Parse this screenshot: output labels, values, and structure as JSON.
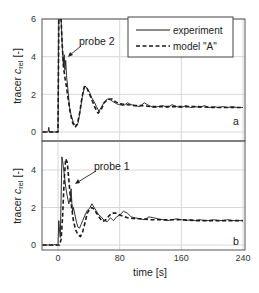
{
  "chart_data": [
    {
      "type": "line",
      "panel": "a",
      "annotation": "probe 2",
      "xlabel": "time [s]",
      "ylabel": "tracer c_rel [-]",
      "xlim": [
        -20,
        240
      ],
      "ylim": [
        -0.5,
        6
      ],
      "xticks": [
        0,
        80,
        160,
        240
      ],
      "yticks": [
        0,
        2,
        4,
        6
      ],
      "grid": true,
      "legend": {
        "position": "upper right",
        "entries": [
          "experiment",
          "model \"A\""
        ]
      },
      "series": [
        {
          "name": "experiment",
          "style": "solid",
          "x": [
            -20,
            -13,
            -12,
            -11,
            0,
            0.5,
            1,
            2,
            3,
            4,
            5,
            6,
            7,
            8,
            9,
            10,
            11,
            12,
            13,
            15,
            17,
            20,
            23,
            26,
            29,
            32,
            35,
            38,
            41,
            44,
            47,
            50,
            53,
            56,
            60,
            64,
            68,
            72,
            76,
            80,
            85,
            90,
            95,
            100,
            106,
            112,
            118,
            124,
            130,
            136,
            142,
            148,
            154,
            160,
            166,
            172,
            178,
            184,
            190,
            196,
            202,
            208,
            214,
            220,
            226,
            232,
            238,
            240
          ],
          "y": [
            0,
            0,
            0.25,
            0,
            0,
            3,
            6,
            6,
            6,
            6,
            5,
            4.2,
            3.6,
            4.1,
            3.3,
            3.8,
            3.0,
            2.6,
            2.2,
            1.3,
            0.9,
            0.5,
            0.35,
            0.45,
            1.2,
            2.0,
            2.45,
            2.3,
            2.1,
            1.8,
            1.6,
            1.35,
            1.1,
            1.3,
            1.6,
            1.75,
            1.7,
            1.6,
            1.5,
            1.45,
            1.4,
            1.55,
            1.45,
            1.4,
            1.35,
            1.55,
            1.4,
            1.3,
            1.35,
            1.4,
            1.3,
            1.45,
            1.35,
            1.3,
            1.4,
            1.3,
            1.35,
            1.3,
            1.4,
            1.3,
            1.35,
            1.3,
            1.35,
            1.3,
            1.35,
            1.3,
            1.3,
            1.3
          ]
        },
        {
          "name": "model \"A\"",
          "style": "dashed",
          "x": [
            -20,
            0,
            1,
            1.5,
            3,
            4,
            5,
            7,
            9,
            11,
            13,
            16,
            19,
            22,
            25,
            28,
            31,
            34,
            37,
            40,
            44,
            48,
            52,
            56,
            60,
            65,
            70,
            75,
            80,
            90,
            100,
            110,
            120,
            140,
            160,
            180,
            200,
            220,
            240
          ],
          "y": [
            0,
            0,
            6,
            6,
            6,
            6,
            5,
            3.5,
            2.9,
            2.4,
            1.8,
            1.0,
            0.5,
            0.25,
            0.4,
            1.0,
            1.8,
            2.4,
            2.4,
            2.1,
            1.7,
            1.3,
            1.0,
            1.2,
            1.55,
            1.75,
            1.75,
            1.6,
            1.5,
            1.45,
            1.4,
            1.4,
            1.35,
            1.35,
            1.35,
            1.35,
            1.3,
            1.3,
            1.3
          ]
        }
      ]
    },
    {
      "type": "line",
      "panel": "b",
      "annotation": "probe 1",
      "xlabel": "time [s]",
      "ylabel": "tracer c_rel [-]",
      "xlim": [
        -20,
        240
      ],
      "ylim": [
        -0.3,
        5.5
      ],
      "xticks": [
        0,
        80,
        160,
        240
      ],
      "yticks": [
        0,
        2,
        4
      ],
      "grid": true,
      "series": [
        {
          "name": "experiment",
          "style": "solid",
          "x": [
            -20,
            -5,
            -4,
            -3,
            -2,
            0,
            1,
            2,
            3,
            4,
            5,
            6,
            8,
            10,
            12,
            14,
            16,
            17,
            18,
            19,
            20,
            22,
            24,
            26,
            28,
            30,
            32,
            35,
            38,
            41,
            44,
            47,
            50,
            53,
            56,
            60,
            64,
            68,
            72,
            76,
            80,
            85,
            90,
            95,
            100,
            106,
            112,
            118,
            124,
            130,
            136,
            142,
            148,
            154,
            160,
            166,
            172,
            178,
            184,
            190,
            196,
            202,
            208,
            214,
            220,
            226,
            232,
            238,
            240
          ],
          "y": [
            0,
            0,
            0.05,
            0,
            0,
            0,
            1.3,
            0.8,
            0.4,
            2.5,
            4.7,
            4.5,
            3.8,
            3.1,
            2.6,
            2.2,
            2.5,
            3.0,
            2.2,
            1.8,
            2.0,
            1.6,
            1.2,
            0.95,
            0.9,
            1.1,
            1.3,
            1.6,
            1.85,
            1.95,
            2.2,
            2.0,
            1.8,
            1.6,
            1.5,
            1.3,
            1.25,
            1.45,
            1.3,
            1.5,
            1.6,
            1.8,
            1.7,
            1.5,
            1.45,
            1.4,
            1.35,
            1.5,
            1.45,
            1.4,
            1.35,
            1.3,
            1.35,
            1.4,
            1.35,
            1.3,
            1.35,
            1.3,
            1.35,
            1.3,
            1.3,
            1.35,
            1.3,
            1.3,
            1.35,
            1.3,
            1.3,
            1.3,
            1.3
          ]
        },
        {
          "name": "model \"A\"",
          "style": "dashed",
          "x": [
            -20,
            2,
            4,
            6,
            8,
            10,
            12,
            14,
            16,
            18,
            20,
            23,
            26,
            29,
            32,
            35,
            38,
            41,
            44,
            47,
            50,
            54,
            58,
            62,
            66,
            70,
            75,
            80,
            90,
            100,
            110,
            120,
            140,
            160,
            180,
            200,
            220,
            240
          ],
          "y": [
            0,
            0,
            0.3,
            1.5,
            3.5,
            4.6,
            4.4,
            3.5,
            2.6,
            1.9,
            1.3,
            0.8,
            0.55,
            0.45,
            0.7,
            1.2,
            1.7,
            1.9,
            2.0,
            1.9,
            1.7,
            1.45,
            1.25,
            1.35,
            1.55,
            1.7,
            1.7,
            1.6,
            1.45,
            1.4,
            1.4,
            1.35,
            1.35,
            1.35,
            1.3,
            1.3,
            1.3,
            1.3
          ]
        }
      ]
    }
  ],
  "panels": {
    "a": {
      "letter": "a",
      "annotation": "probe 2"
    },
    "b": {
      "letter": "b",
      "annotation": "probe 1"
    }
  },
  "axes": {
    "xlabel": "time [s]",
    "ylabel_main": "tracer ",
    "ylabel_var": "c",
    "ylabel_sub": "rel",
    "ylabel_unit": " [-]",
    "xticks": [
      "0",
      "80",
      "160",
      "240"
    ],
    "yticks_top": [
      "0",
      "2",
      "4",
      "6"
    ],
    "yticks_bottom": [
      "0",
      "2",
      "4"
    ]
  },
  "legend": {
    "experiment": "experiment",
    "model": "model \"A\""
  },
  "colors": {
    "line": "#1a1a1a",
    "grid": "#d8d8d8",
    "frame": "#555555"
  }
}
